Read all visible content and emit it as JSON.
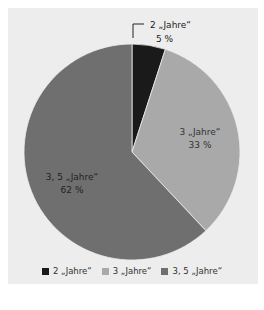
{
  "chart_data": {
    "type": "pie",
    "title": "",
    "categories": [
      "2 „Jahre“",
      "3 „Jahre“",
      "3, 5 „Jahre“"
    ],
    "values": [
      5,
      33,
      62
    ],
    "unit": "%",
    "colors": [
      "#1a1a1a",
      "#a9a9a9",
      "#6f6f6f"
    ],
    "labels": [
      {
        "name": "2 „Jahre“",
        "value": "5 %"
      },
      {
        "name": "3 „Jahre“",
        "value": "33 %"
      },
      {
        "name": "3, 5 „Jahre“",
        "value": "62 %"
      }
    ],
    "legend_position": "bottom",
    "legend": [
      "2 „Jahre“",
      "3 „Jahre“",
      "3, 5 „Jahre“"
    ]
  }
}
